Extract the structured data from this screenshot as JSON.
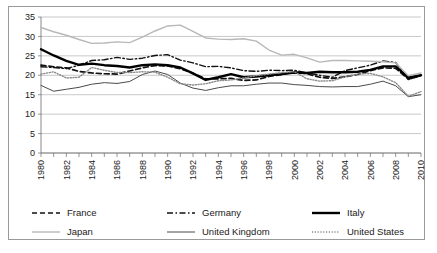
{
  "chart_data": {
    "type": "line",
    "title": "",
    "subtitle": "",
    "xlabel": "",
    "ylabel": "",
    "xlim": [
      1980,
      2010
    ],
    "ylim": [
      0,
      35
    ],
    "ytick_step": 5,
    "yticks": [
      "0",
      "5",
      "10",
      "15",
      "20",
      "25",
      "30",
      "35"
    ],
    "grid": "horizontal",
    "legend_position": "bottom",
    "x": [
      1980,
      1981,
      1982,
      1983,
      1984,
      1985,
      1986,
      1987,
      1988,
      1989,
      1990,
      1991,
      1992,
      1993,
      1994,
      1995,
      1996,
      1997,
      1998,
      1999,
      2000,
      2001,
      2002,
      2003,
      2004,
      2005,
      2006,
      2007,
      2008,
      2009,
      2010
    ],
    "xtick_labels": [
      "1980",
      "1982",
      "1984",
      "1986",
      "1988",
      "1990",
      "1992",
      "1994",
      "1996",
      "1998",
      "2000",
      "2002",
      "2004",
      "2006",
      "2008",
      "2010"
    ],
    "series": [
      {
        "name": "France",
        "style": "dashed",
        "color": "#111111",
        "width": 1.7,
        "values": [
          22.6,
          22.2,
          21.9,
          21.0,
          20.6,
          20.4,
          20.3,
          21.1,
          21.9,
          22.5,
          22.4,
          21.7,
          20.5,
          19.1,
          19.1,
          19.2,
          18.7,
          18.8,
          19.7,
          20.2,
          20.8,
          20.4,
          19.5,
          19.2,
          19.6,
          20.2,
          21.2,
          21.9,
          21.8,
          19.0,
          19.9
        ]
      },
      {
        "name": "Germany",
        "style": "dashdot",
        "color": "#111111",
        "width": 1.4,
        "values": [
          22.2,
          22.0,
          21.7,
          22.6,
          23.8,
          24.0,
          24.6,
          24.1,
          24.4,
          25.1,
          25.3,
          23.9,
          23.2,
          22.2,
          22.3,
          21.9,
          21.2,
          21.0,
          21.3,
          21.2,
          21.3,
          20.6,
          20.0,
          19.5,
          21.2,
          21.9,
          22.6,
          23.7,
          23.3,
          18.9,
          20.0
        ]
      },
      {
        "name": "Italy",
        "style": "solid",
        "color": "#000000",
        "width": 2.4,
        "values": [
          26.7,
          25.1,
          23.7,
          22.7,
          23.0,
          22.6,
          22.4,
          22.0,
          22.6,
          22.8,
          22.6,
          22.0,
          20.5,
          18.8,
          19.5,
          20.3,
          19.5,
          19.7,
          20.0,
          20.3,
          20.7,
          20.6,
          20.9,
          20.8,
          20.8,
          20.9,
          21.4,
          22.3,
          22.3,
          19.4,
          20.0
        ]
      },
      {
        "name": "Japan",
        "style": "solid",
        "color": "#b8b8b8",
        "width": 1.4,
        "values": [
          32.3,
          31.2,
          30.3,
          29.2,
          28.2,
          28.3,
          28.6,
          28.4,
          29.8,
          31.4,
          32.7,
          32.9,
          31.3,
          29.6,
          29.3,
          29.2,
          29.4,
          28.8,
          26.5,
          25.2,
          25.4,
          24.5,
          23.4,
          23.8,
          23.8,
          23.7,
          23.6,
          23.5,
          23.2,
          19.9,
          20.6
        ]
      },
      {
        "name": "United Kingdom",
        "style": "solid",
        "color": "#4a4a4a",
        "width": 1.0,
        "values": [
          17.4,
          15.9,
          16.4,
          16.9,
          17.7,
          18.1,
          17.9,
          18.4,
          20.2,
          21.1,
          20.2,
          18.0,
          16.7,
          16.1,
          16.8,
          17.3,
          17.3,
          17.7,
          18.0,
          18.0,
          17.6,
          17.4,
          17.1,
          17.0,
          17.1,
          17.1,
          17.7,
          18.5,
          17.3,
          14.5,
          15.0
        ]
      },
      {
        "name": "United States",
        "style": "dotted",
        "color": "#8a8a8a",
        "width": 1.4,
        "values": [
          20.3,
          20.9,
          19.3,
          19.5,
          22.0,
          21.3,
          20.7,
          20.7,
          20.9,
          20.8,
          19.5,
          17.8,
          17.5,
          17.8,
          18.6,
          18.8,
          19.3,
          19.9,
          20.3,
          20.7,
          20.9,
          19.1,
          18.5,
          18.6,
          19.6,
          20.3,
          20.5,
          19.6,
          18.1,
          14.6,
          15.8
        ]
      }
    ]
  },
  "legend": {
    "items": [
      {
        "label": "France",
        "style": "dashed",
        "color": "#111111"
      },
      {
        "label": "Germany",
        "style": "dashdot",
        "color": "#111111"
      },
      {
        "label": "Italy",
        "style": "solid",
        "color": "#000000"
      },
      {
        "label": "Japan",
        "style": "solid",
        "color": "#b8b8b8"
      },
      {
        "label": "United Kingdom",
        "style": "solid",
        "color": "#4a4a4a"
      },
      {
        "label": "United States",
        "style": "dotted",
        "color": "#8a8a8a"
      }
    ]
  }
}
